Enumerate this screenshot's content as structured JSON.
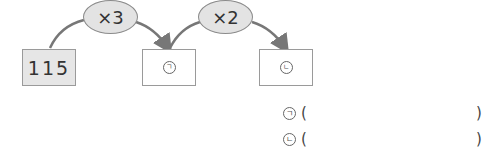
{
  "diagram": {
    "start_value": "115",
    "ops": [
      {
        "label": "×3"
      },
      {
        "label": "×2"
      }
    ],
    "boxes": [
      {
        "mark": "ㄱ"
      },
      {
        "mark": "ㄴ"
      }
    ]
  },
  "answers": [
    {
      "mark": "ㄱ",
      "open": "(",
      "close": ")"
    },
    {
      "mark": "ㄴ",
      "open": "(",
      "close": ")"
    }
  ]
}
